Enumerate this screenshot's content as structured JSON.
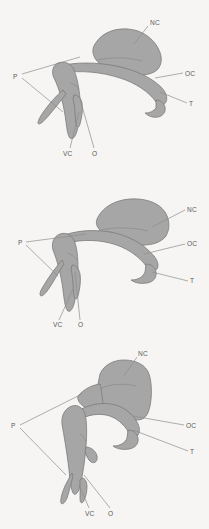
{
  "figure": {
    "name": "comparative-anatomy-plate",
    "background_color": "#f6f5f3",
    "fill_color": "#a6a6a6",
    "outline_color": "#7b7b7b",
    "label_color": "#5a5a5a",
    "leader_color": "#8d8d8d",
    "panel_count": 3
  },
  "panels": [
    {
      "id": "panel-a",
      "name": "specimen-top",
      "labels": [
        {
          "text": "NC",
          "x": 152,
          "y": 22
        },
        {
          "text": "OC",
          "x": 186,
          "y": 75
        },
        {
          "text": "T",
          "x": 190,
          "y": 105
        },
        {
          "text": "P",
          "x": 14,
          "y": 76
        },
        {
          "text": "VC",
          "x": 66,
          "y": 155
        },
        {
          "text": "O",
          "x": 94,
          "y": 155
        }
      ]
    },
    {
      "id": "panel-b",
      "name": "specimen-middle",
      "labels": [
        {
          "text": "NC",
          "x": 188,
          "y": 211
        },
        {
          "text": "OC",
          "x": 188,
          "y": 245
        },
        {
          "text": "T",
          "x": 191,
          "y": 281
        },
        {
          "text": "P",
          "x": 19,
          "y": 243
        },
        {
          "text": "VC",
          "x": 56,
          "y": 325
        },
        {
          "text": "O",
          "x": 80,
          "y": 325
        }
      ]
    },
    {
      "id": "panel-c",
      "name": "specimen-bottom",
      "labels": [
        {
          "text": "NC",
          "x": 139,
          "y": 353
        },
        {
          "text": "OC",
          "x": 189,
          "y": 427
        },
        {
          "text": "T",
          "x": 191,
          "y": 453
        },
        {
          "text": "P",
          "x": 12,
          "y": 424
        },
        {
          "text": "VC",
          "x": 88,
          "y": 513
        },
        {
          "text": "O",
          "x": 110,
          "y": 513
        }
      ]
    }
  ],
  "legend": {
    "NC": "NC",
    "OC": "OC",
    "T": "T",
    "P": "P",
    "VC": "VC",
    "O": "O"
  }
}
